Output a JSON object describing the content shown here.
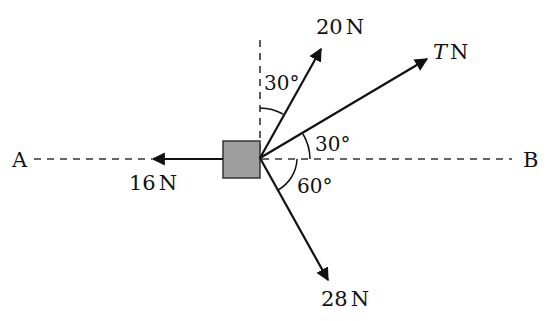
{
  "diagram": {
    "type": "force-diagram",
    "points": {
      "left": "A",
      "right": "B"
    },
    "object": {
      "shape": "square",
      "fill": "#9e9e9e",
      "stroke": "#333333"
    },
    "forces": [
      {
        "id": "f20",
        "magnitude_label": "20",
        "unit": "N",
        "direction": "30° from vertical (upward, to the right)"
      },
      {
        "id": "fT",
        "magnitude_label": "T",
        "unit": "N",
        "direction": "30° above line AB towards B"
      },
      {
        "id": "f28",
        "magnitude_label": "28",
        "unit": "N",
        "direction": "60° below line AB towards B"
      },
      {
        "id": "f16",
        "magnitude_label": "16",
        "unit": "N",
        "direction": "along line towards A"
      }
    ],
    "angles": [
      {
        "id": "a1",
        "label": "30°",
        "between": "vertical and 20 N"
      },
      {
        "id": "a2",
        "label": "30°",
        "between": "AB and T N"
      },
      {
        "id": "a3",
        "label": "60°",
        "between": "AB and 28 N"
      }
    ],
    "colors": {
      "line": "#111111",
      "dashed": "#333333",
      "box_fill": "#9e9e9e"
    }
  }
}
